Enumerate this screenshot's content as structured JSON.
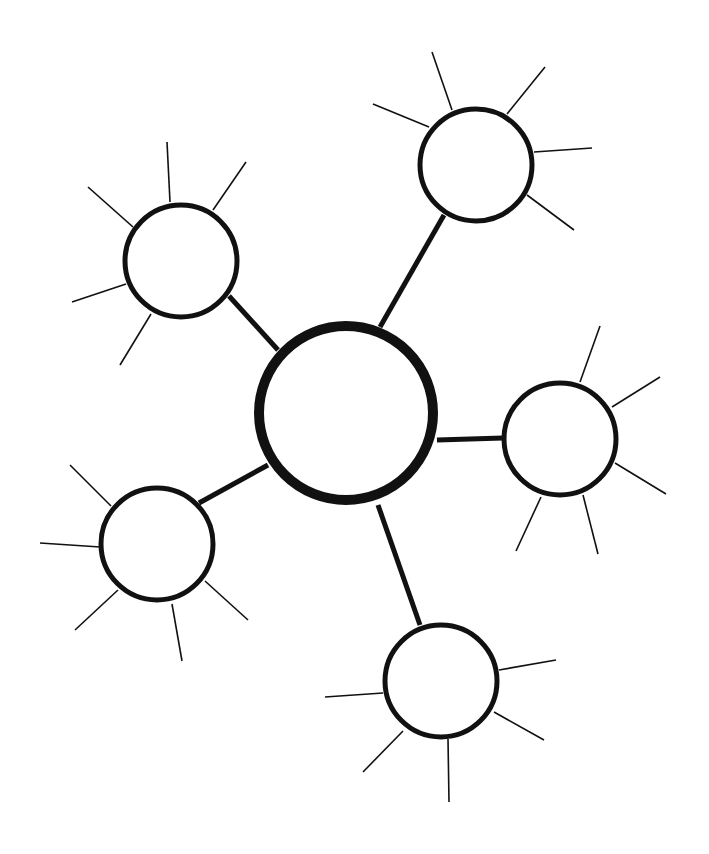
{
  "diagram": {
    "type": "mind-map",
    "width": 709,
    "height": 854,
    "colors": {
      "stroke": "#111111",
      "fill": "#ffffff",
      "background": "#ffffff"
    },
    "center": {
      "id": "center",
      "cx": 346,
      "cy": 413,
      "r": 87,
      "stroke_width": 10
    },
    "nodes": [
      {
        "id": "node-top-right",
        "cx": 476,
        "cy": 165,
        "r": 56,
        "stroke_width": 5,
        "connector": {
          "x1": 380,
          "y1": 327,
          "x2": 444,
          "y2": 215
        },
        "spokes": [
          [
            452,
            110,
            432,
            52
          ],
          [
            429,
            127,
            373,
            104
          ],
          [
            507,
            114,
            545,
            67
          ],
          [
            534,
            152,
            592,
            148
          ],
          [
            527,
            195,
            574,
            230
          ]
        ]
      },
      {
        "id": "node-top-left",
        "cx": 181,
        "cy": 261,
        "r": 56,
        "stroke_width": 5,
        "connector": {
          "x1": 278,
          "y1": 350,
          "x2": 229,
          "y2": 296
        },
        "spokes": [
          [
            170,
            202,
            167,
            142
          ],
          [
            213,
            210,
            246,
            162
          ],
          [
            133,
            227,
            88,
            187
          ],
          [
            126,
            284,
            72,
            302
          ],
          [
            151,
            314,
            120,
            365
          ]
        ]
      },
      {
        "id": "node-right",
        "cx": 560,
        "cy": 439,
        "r": 56,
        "stroke_width": 5,
        "connector": {
          "x1": 437,
          "y1": 440,
          "x2": 503,
          "y2": 438
        },
        "spokes": [
          [
            580,
            382,
            600,
            326
          ],
          [
            612,
            407,
            660,
            377
          ],
          [
            615,
            463,
            666,
            494
          ],
          [
            583,
            495,
            598,
            554
          ],
          [
            541,
            497,
            516,
            551
          ]
        ]
      },
      {
        "id": "node-bottom-left",
        "cx": 157,
        "cy": 544,
        "r": 56,
        "stroke_width": 5,
        "connector": {
          "x1": 268,
          "y1": 465,
          "x2": 199,
          "y2": 503
        },
        "spokes": [
          [
            111,
            506,
            70,
            465
          ],
          [
            100,
            547,
            40,
            543
          ],
          [
            118,
            590,
            75,
            630
          ],
          [
            172,
            604,
            182,
            661
          ],
          [
            205,
            581,
            248,
            620
          ]
        ]
      },
      {
        "id": "node-bottom",
        "cx": 441,
        "cy": 681,
        "r": 56,
        "stroke_width": 5,
        "connector": {
          "x1": 378,
          "y1": 505,
          "x2": 420,
          "y2": 625
        },
        "spokes": [
          [
            499,
            670,
            556,
            660
          ],
          [
            494,
            712,
            544,
            740
          ],
          [
            448,
            739,
            449,
            802
          ],
          [
            403,
            731,
            363,
            772
          ],
          [
            383,
            693,
            325,
            697
          ]
        ]
      }
    ]
  }
}
